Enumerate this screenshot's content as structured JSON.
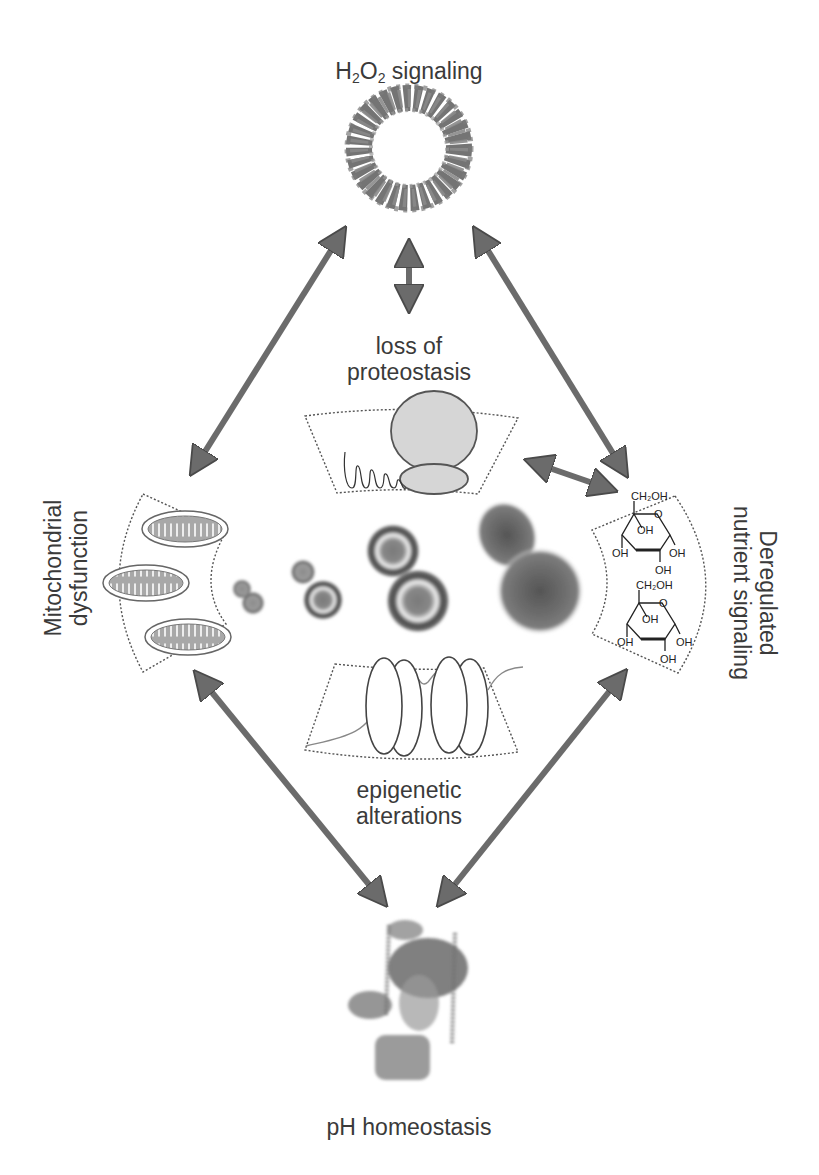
{
  "figure": {
    "nodes": {
      "top": {
        "label_prefix": "H",
        "sub1": "2",
        "mid": "O",
        "sub2": "2",
        "label_suffix": " signaling",
        "full_label": "H2O2 signaling",
        "image": "peroxiredoxin-ring-protein-structure"
      },
      "left": {
        "line1": "Mitochondrial",
        "line2": "dysfunction",
        "image": "mitochondria-panel"
      },
      "right": {
        "line1": "Deregulated",
        "line2": "nutrient signaling",
        "image": "glucose-molecules-panel"
      },
      "bottom": {
        "label": "pH homeostasis",
        "image": "v-atpase-protein-structure"
      },
      "proteostasis": {
        "line1": "loss of",
        "line2": "proteostasis",
        "image": "ribosome-nascent-chain-panel"
      },
      "epigenetic": {
        "line1": "epigenetic",
        "line2": "alterations",
        "image": "nucleosome-panel"
      },
      "center": {
        "image": "aging-yeast-cells-series",
        "cell_count": 4
      }
    },
    "glucose_labels": {
      "ch2oh": "CH₂OH",
      "oh": "OH",
      "o": "O"
    },
    "edges": [
      {
        "from": "top",
        "to": "left",
        "type": "bidirectional"
      },
      {
        "from": "top",
        "to": "right",
        "type": "bidirectional"
      },
      {
        "from": "top",
        "to": "proteostasis",
        "type": "bidirectional"
      },
      {
        "from": "proteostasis",
        "to": "right",
        "type": "bidirectional"
      },
      {
        "from": "left",
        "to": "bottom",
        "type": "bidirectional"
      },
      {
        "from": "right",
        "to": "bottom",
        "type": "bidirectional"
      }
    ],
    "colors": {
      "arrow": "#6b6b6b",
      "arrow_outline": "#4a4a4a",
      "panel_fill": "#d6d6d6",
      "text": "#3a3a3a",
      "dash": "#555555"
    }
  }
}
